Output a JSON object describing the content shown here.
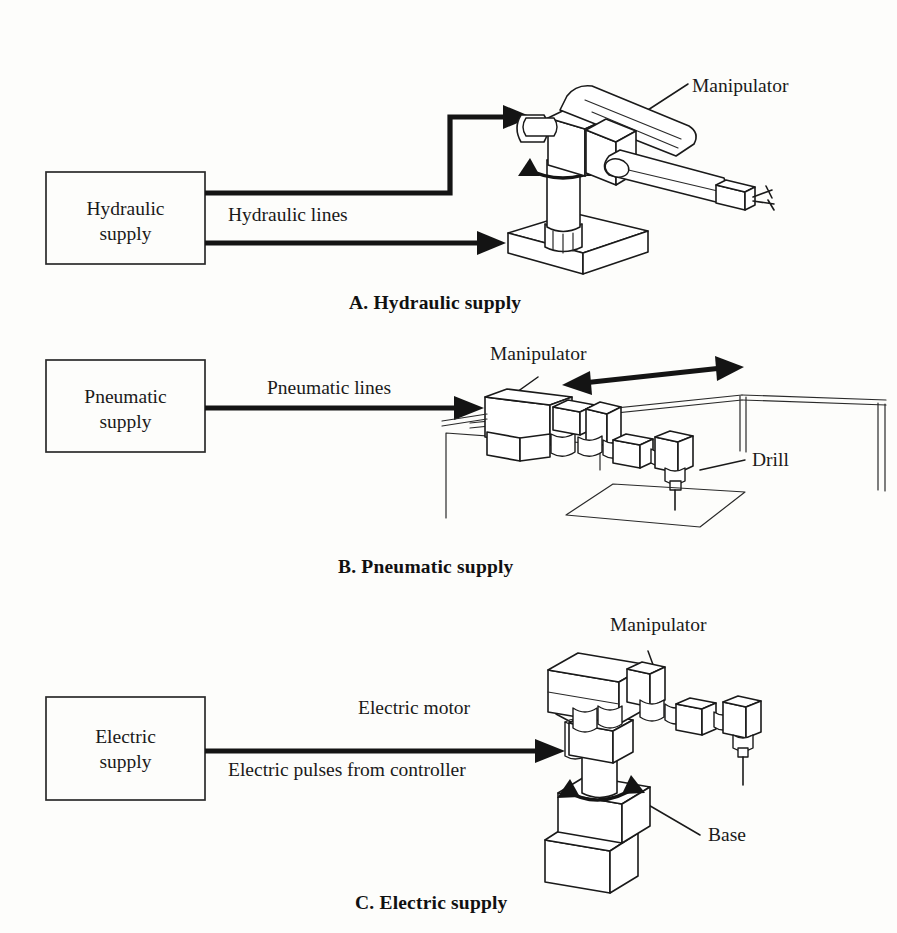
{
  "figure": {
    "background_color": "#fdfdfb",
    "ink_color": "#1a1a1a"
  },
  "panels": [
    {
      "id": "A",
      "caption": "A.  Hydraulic supply",
      "supply_box": {
        "line1": "Hydraulic",
        "line2": "supply"
      },
      "line_label": "Hydraulic lines",
      "callouts": [
        {
          "text": "Manipulator"
        }
      ],
      "robot_type": "articulated-arm-on-pedestal"
    },
    {
      "id": "B",
      "caption": "B.  Pneumatic supply",
      "supply_box": {
        "line1": "Pneumatic",
        "line2": "supply"
      },
      "line_label": "Pneumatic lines",
      "callouts": [
        {
          "text": "Manipulator"
        },
        {
          "text": "Drill"
        }
      ],
      "robot_type": "gantry-robot-with-drill"
    },
    {
      "id": "C",
      "caption": "C.  Electric supply",
      "supply_box": {
        "line1": "Electric",
        "line2": "supply"
      },
      "line_label": "Electric pulses from controller",
      "callouts": [
        {
          "text": "Manipulator"
        },
        {
          "text": "Electric motor"
        },
        {
          "text": "Base"
        }
      ],
      "robot_type": "electric-robot-on-base"
    }
  ]
}
